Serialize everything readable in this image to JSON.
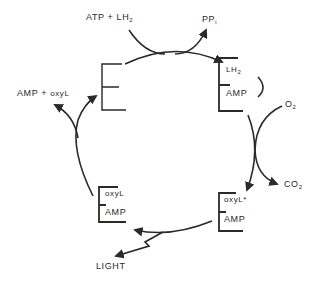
{
  "diagram": {
    "stroke_color": "#2a2a2a",
    "nodes": {
      "enzyme_free": {
        "label": "E"
      },
      "enzyme_lh2_amp": {
        "bracket": "E",
        "top": "LH",
        "top_sub": "2",
        "bottom": "AMP"
      },
      "enzyme_oxyl_excited_amp": {
        "bracket": "E",
        "top": "oxyL*",
        "bottom": "AMP"
      },
      "enzyme_oxyl_amp": {
        "bracket": "E",
        "top": "oxyL",
        "bottom": "AMP"
      }
    },
    "side_labels": {
      "substrates": {
        "main": "ATP + LH",
        "sub": "2"
      },
      "pyrophosphate": {
        "main": "PP",
        "sub": "i"
      },
      "oxygen": {
        "main": "O",
        "sub": "2"
      },
      "carbon_dioxide": {
        "main": "CO",
        "sub": "2"
      },
      "light": {
        "main": "LIGHT"
      },
      "products": {
        "main": "AMP + ",
        "tail": "oxyL"
      }
    },
    "edges": [
      {
        "from": "enzyme_free",
        "to": "enzyme_lh2_amp",
        "in": "ATP + LH2",
        "out": "PPi"
      },
      {
        "from": "enzyme_lh2_amp",
        "to": "enzyme_oxyl_excited_amp",
        "in": "O2",
        "out": "CO2"
      },
      {
        "from": "enzyme_oxyl_excited_amp",
        "to": "enzyme_oxyl_amp",
        "out": "LIGHT"
      },
      {
        "from": "enzyme_oxyl_amp",
        "to": "enzyme_free",
        "out": "AMP + oxyL"
      }
    ]
  }
}
